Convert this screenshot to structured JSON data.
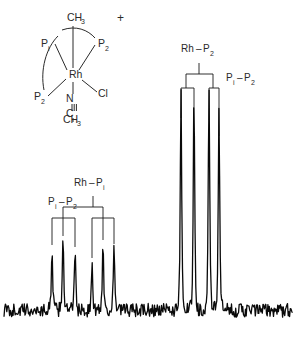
{
  "figure": {
    "kind": "nmr-spectrum",
    "caption": "",
    "background_color": "#ffffff",
    "ink_color": "#1a1a1a"
  },
  "structure": {
    "name": "rhodium-complex-diagram",
    "charge_label": "+",
    "center_atom": "Rh",
    "labels": {
      "methyl_top": "CH",
      "methyl_top_sub": "3",
      "p1": "P",
      "p1_sub": "i",
      "p2_top": "P",
      "p2_top_sub": "2",
      "p2_bottom": "P",
      "p2_bottom_sub": "2",
      "chloride": "Cl",
      "nitrogen": "N",
      "nitrile_carbon": "C",
      "methyl_bottom": "CH",
      "methyl_bottom_sub": "3"
    }
  },
  "annotations": {
    "left_group": {
      "name": "left-multiplet-tree",
      "primary_coupling": {
        "a": "Rh",
        "dash": "–",
        "b": "P",
        "b_sub": "i"
      },
      "secondary_coupling": {
        "a": "P",
        "a_sub": "i",
        "dash": "–",
        "b": "P",
        "b_sub": "2"
      }
    },
    "right_group": {
      "name": "right-multiplet-tree",
      "primary_coupling": {
        "a": "Rh",
        "dash": "–",
        "b": "P",
        "b_sub": "2"
      },
      "secondary_coupling": {
        "a": "P",
        "a_sub": "i",
        "dash": "–",
        "b": "P",
        "b_sub": "2"
      }
    }
  },
  "chart_data": {
    "type": "line",
    "title": "",
    "subtitle": "",
    "xlabel": "",
    "ylabel": "",
    "xlim": [
      0,
      297
    ],
    "ylim": [
      0,
      1
    ],
    "grid": false,
    "legend": null,
    "baseline_y": 311,
    "noise_amplitude": 0.022,
    "series": [
      {
        "name": "phosphorus-31-spectrum",
        "color": "#0a0a0a",
        "peaks": [
          {
            "id": "L1",
            "x": 52,
            "height": 0.215,
            "group": "left",
            "width": 1.3
          },
          {
            "id": "L2",
            "x": 63,
            "height": 0.26,
            "group": "left",
            "width": 1.3
          },
          {
            "id": "L3",
            "x": 75,
            "height": 0.205,
            "group": "left",
            "width": 1.3
          },
          {
            "id": "L4",
            "x": 92,
            "height": 0.145,
            "group": "left",
            "width": 1.3
          },
          {
            "id": "L5",
            "x": 103,
            "height": 0.225,
            "group": "left",
            "width": 1.3
          },
          {
            "id": "L6",
            "x": 114,
            "height": 0.205,
            "group": "left",
            "width": 1.3
          },
          {
            "id": "R1",
            "x": 181,
            "height": 0.76,
            "group": "right",
            "width": 1.3
          },
          {
            "id": "R2",
            "x": 194,
            "height": 0.735,
            "group": "right",
            "width": 1.3
          },
          {
            "id": "R3",
            "x": 209,
            "height": 0.755,
            "group": "right",
            "width": 1.3
          },
          {
            "id": "R4",
            "x": 219,
            "height": 0.7,
            "group": "right",
            "width": 1.3
          }
        ]
      }
    ],
    "trees": [
      {
        "group": "left",
        "stem_x": 93,
        "stem_top_y": 196,
        "levels": [
          {
            "label": "Rh-Pi",
            "y": 207,
            "branch_xs": [
              63,
              103
            ]
          },
          {
            "label": "Pi-P2",
            "y": 218,
            "branch_xs": [
              52,
              75,
              92,
              114
            ]
          }
        ],
        "tick_bottom_y": 238
      },
      {
        "group": "right",
        "stem_x": 199,
        "stem_top_y": 63,
        "levels": [
          {
            "label": "Rh-P2",
            "y": 74,
            "branch_xs": [
              186,
              213
            ]
          },
          {
            "label": "Pi-P2",
            "y": 88,
            "branch_xs": [
              181,
              194,
              209,
              219
            ]
          }
        ],
        "tick_bottom_y": 118
      }
    ]
  }
}
